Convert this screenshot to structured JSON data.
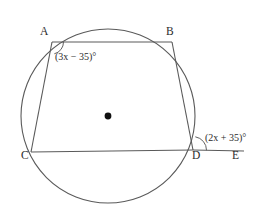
{
  "figure": {
    "kind": "cyclic-quadrilateral-in-circle",
    "stroke_color": "#555555",
    "text_color": "#2b2b2b",
    "background_color": "#ffffff",
    "circle": {
      "cx": 108,
      "cy": 116,
      "r": 87
    },
    "center_dot": {
      "cx": 108,
      "cy": 116,
      "r": 3.4
    },
    "vertices": [
      {
        "name": "A",
        "label": "A",
        "x": 52,
        "y": 42,
        "label_x": 40,
        "label_y": 26
      },
      {
        "name": "B",
        "label": "B",
        "x": 172,
        "y": 42,
        "label_x": 166,
        "label_y": 26
      },
      {
        "name": "C",
        "label": "C",
        "x": 31,
        "y": 152,
        "label_x": 21,
        "label_y": 150
      },
      {
        "name": "D",
        "label": "D",
        "x": 193,
        "y": 150,
        "label_x": 192,
        "label_y": 150
      },
      {
        "name": "E",
        "label": "E",
        "x": 232,
        "y": 151,
        "label_x": 232,
        "label_y": 150
      }
    ],
    "segments": [
      {
        "name": "segment-AB",
        "from": "A",
        "to": "B",
        "x1": 52,
        "y1": 42,
        "x2": 172,
        "y2": 42
      },
      {
        "name": "segment-AC",
        "from": "A",
        "to": "C",
        "x1": 52,
        "y1": 42,
        "x2": 31,
        "y2": 152
      },
      {
        "name": "segment-BD",
        "from": "B",
        "to": "D",
        "x1": 172,
        "y1": 42,
        "x2": 193,
        "y2": 150
      },
      {
        "name": "segment-CD",
        "from": "C",
        "to": "D",
        "x1": 31,
        "y1": 152,
        "x2": 193,
        "y2": 150
      },
      {
        "name": "ray-DE",
        "from": "D",
        "to": "E",
        "x1": 193,
        "y1": 150,
        "x2": 244,
        "y2": 151
      }
    ],
    "angle_arcs": [
      {
        "name": "angle-arc-a",
        "at": "A",
        "path": "M 63.5 42 A 12 12 0 0 1 54.3 53.8"
      },
      {
        "name": "angle-arc-d",
        "at": "D",
        "path": "M 195.3 136.8 A 13.5 13.5 0 0 1 206.5 150.3"
      }
    ],
    "angle_labels": [
      {
        "name": "angle-label-a",
        "at": "A",
        "text": "(3x − 35)°",
        "expression": "3x - 35",
        "unit": "degrees",
        "x": 55,
        "y": 52
      },
      {
        "name": "angle-label-d",
        "at": "D",
        "text": "(2x + 35)°",
        "expression": "2x + 35",
        "unit": "degrees",
        "x": 205,
        "y": 133
      }
    ]
  }
}
